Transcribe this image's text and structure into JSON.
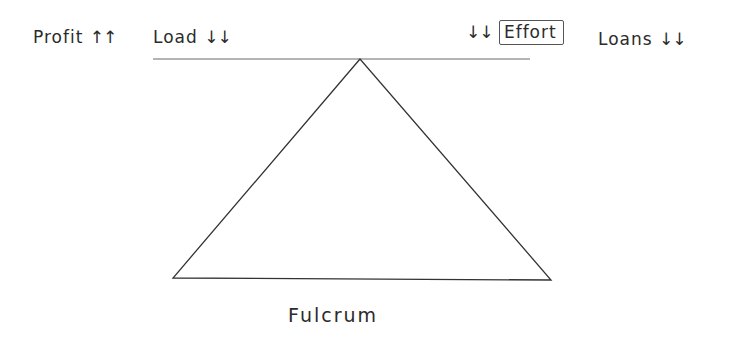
{
  "diagram": {
    "type": "lever-fulcrum-sketch",
    "style": "hand-drawn",
    "colors": {
      "ink": "#2b2b2b",
      "background": "#ffffff"
    },
    "beam": {
      "x1": 153,
      "y1": 59,
      "x2": 530,
      "y2": 59
    },
    "triangle": {
      "apex": [
        360,
        59
      ],
      "base_left": [
        173,
        278
      ],
      "base_right": [
        551,
        280
      ]
    },
    "labels": {
      "profit": {
        "text": "Profit",
        "arrows": "↑↑",
        "arrow_direction": "up"
      },
      "load": {
        "text": "Load",
        "arrows": "↓↓",
        "arrow_direction": "down"
      },
      "effort": {
        "text": "Effort",
        "arrows": "↓↓",
        "arrow_direction": "down",
        "boxed": true
      },
      "loans": {
        "text": "Loans",
        "arrows": "↓↓",
        "arrow_direction": "down"
      },
      "fulcrum": {
        "text": "Fulcrum"
      }
    }
  }
}
